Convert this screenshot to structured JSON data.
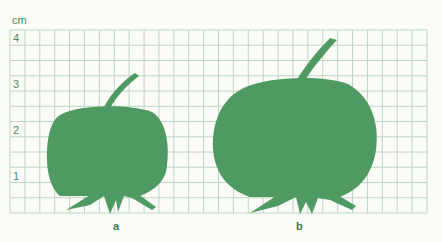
{
  "figure": {
    "unit_label": "cm",
    "y_ticks": [
      "4",
      "3",
      "2",
      "1"
    ],
    "colors": {
      "fruit": "#4f9a63",
      "grid": "#bcd6c3",
      "text": "#4a8a5a"
    },
    "specimens": [
      {
        "id": "a",
        "caption": "a",
        "height_cm": 2.6,
        "width_cm": 2.6
      },
      {
        "id": "b",
        "caption": "b",
        "height_cm": 3.2,
        "width_cm": 3.6
      }
    ]
  }
}
